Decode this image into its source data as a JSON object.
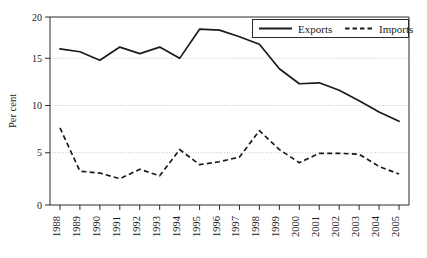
{
  "chart_data": {
    "type": "line",
    "title": "",
    "xlabel": "",
    "ylabel": "Per cent",
    "ylim": [
      0,
      20
    ],
    "yticks": [
      0,
      5,
      10,
      15,
      20
    ],
    "grid": "horizontal-dotted",
    "legend_position": "top-right",
    "categories": [
      "1988",
      "1989",
      "1990",
      "1991",
      "1992",
      "1993",
      "1994",
      "1995",
      "1996",
      "1997",
      "1998",
      "1999",
      "2000",
      "2001",
      "2002",
      "2003",
      "2004",
      "2005"
    ],
    "series": [
      {
        "name": "Exports",
        "style": "solid",
        "color": "#1a1a1a",
        "values": [
          16.6,
          16.3,
          15.4,
          16.8,
          16.1,
          16.8,
          15.6,
          18.7,
          18.6,
          17.9,
          17.1,
          14.5,
          12.9,
          13.0,
          12.2,
          11.1,
          9.9,
          8.9
        ]
      },
      {
        "name": "Imports",
        "style": "dashed",
        "color": "#1a1a1a",
        "values": [
          8.2,
          3.6,
          3.4,
          2.8,
          3.8,
          3.1,
          5.9,
          4.3,
          4.6,
          5.1,
          7.9,
          5.9,
          4.5,
          5.5,
          5.5,
          5.4,
          4.1,
          3.3
        ]
      }
    ]
  },
  "yaxis": {
    "title": "Per cent",
    "tick_labels": [
      "20",
      "15",
      "10",
      "5",
      "0"
    ]
  },
  "xaxis": {
    "tick_labels": [
      "1988",
      "1989",
      "1990",
      "1991",
      "1992",
      "1993",
      "1994",
      "1995",
      "1996",
      "1997",
      "1998",
      "1999",
      "2000",
      "2001",
      "2002",
      "2003",
      "2004",
      "2005"
    ]
  },
  "legend": {
    "entries": [
      {
        "label": "Exports",
        "style": "solid"
      },
      {
        "label": "Imports",
        "style": "dashed"
      }
    ]
  }
}
